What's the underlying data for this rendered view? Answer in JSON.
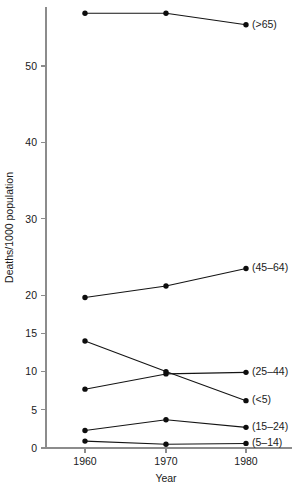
{
  "chart_data": {
    "type": "line",
    "title": "",
    "xlabel": "Year",
    "ylabel": "Deaths/1000 population",
    "x": [
      1960,
      1970,
      1980
    ],
    "xtick_labels": [
      "1960",
      "1970",
      "1980"
    ],
    "ytick_values": [
      0,
      5,
      10,
      15,
      20,
      30,
      40,
      50
    ],
    "ytick_labels": [
      "0",
      "5",
      "10",
      "15",
      "20",
      "30",
      "40",
      "50"
    ],
    "xlim": [
      1955,
      1984
    ],
    "ylim": [
      0,
      58.5
    ],
    "grid": false,
    "legend_position": "right-inline-labels",
    "marker": "filled-circle",
    "series": [
      {
        "name": "(>65)",
        "label": "(>65)",
        "values": [
          56.9,
          56.9,
          55.4
        ]
      },
      {
        "name": "(45-64)",
        "label": "(45–64)",
        "values": [
          19.7,
          21.2,
          23.5
        ]
      },
      {
        "name": "(25-44)",
        "label": "(25–44)",
        "values": [
          7.7,
          9.7,
          9.9
        ]
      },
      {
        "name": "(<5)",
        "label": "(<5)",
        "values": [
          14.0,
          10.0,
          6.2
        ]
      },
      {
        "name": "(15-24)",
        "label": "(15–24)",
        "values": [
          2.3,
          3.7,
          2.7
        ]
      },
      {
        "name": "(5-14)",
        "label": "(5–14)",
        "values": [
          0.9,
          0.5,
          0.6
        ]
      }
    ]
  },
  "colors": {
    "line": "#141414",
    "marker": "#0d0d0d",
    "axis": "#8c8c8c",
    "text": "#1a1a1a",
    "background": "#ffffff"
  }
}
